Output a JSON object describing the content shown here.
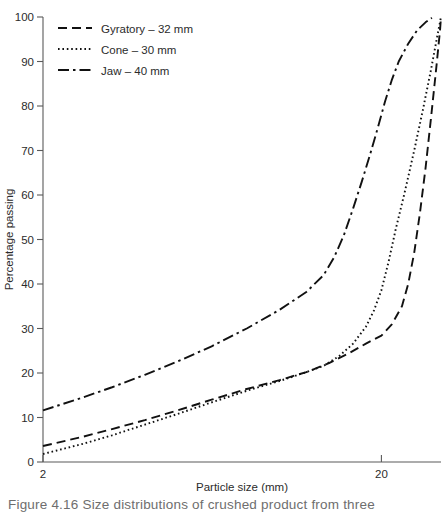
{
  "figure": {
    "caption": "Figure 4.16  Size distributions of crushed product from three"
  },
  "chart_data": {
    "type": "line",
    "title": "",
    "xlabel": "Particle size (mm)",
    "ylabel": "Percentage passing",
    "xscale": "log",
    "xlim": [
      2,
      30
    ],
    "ylim": [
      0,
      100
    ],
    "grid": false,
    "legend_position": "top-left",
    "xticks": [
      {
        "value": 2,
        "label": "2"
      },
      {
        "value": 20,
        "label": "20"
      }
    ],
    "yticks": [
      {
        "value": 0,
        "label": "0"
      },
      {
        "value": 10,
        "label": "10"
      },
      {
        "value": 20,
        "label": "20"
      },
      {
        "value": 30,
        "label": "30"
      },
      {
        "value": 40,
        "label": "40"
      },
      {
        "value": 50,
        "label": "50"
      },
      {
        "value": 60,
        "label": "60"
      },
      {
        "value": 70,
        "label": "70"
      },
      {
        "value": 80,
        "label": "80"
      },
      {
        "value": 90,
        "label": "90"
      },
      {
        "value": 100,
        "label": "100"
      }
    ],
    "series": [
      {
        "name": "Gyratory – 32 mm",
        "legend_label": "Gyratory – 32 mm",
        "style": "dashed",
        "dasharray": "9,5",
        "points": [
          [
            2.0,
            3.6
          ],
          [
            2.6,
            5.6
          ],
          [
            3.2,
            7.4
          ],
          [
            4.0,
            9.4
          ],
          [
            5.0,
            11.6
          ],
          [
            6.3,
            14.0
          ],
          [
            8.0,
            16.4
          ],
          [
            10.0,
            18.4
          ],
          [
            12.0,
            20.2
          ],
          [
            14.0,
            22.2
          ],
          [
            16.0,
            24.4
          ],
          [
            18.0,
            26.6
          ],
          [
            20.0,
            28.4
          ],
          [
            21.5,
            31.0
          ],
          [
            23.0,
            35.0
          ],
          [
            24.0,
            40.0
          ],
          [
            25.0,
            47.0
          ],
          [
            26.0,
            56.0
          ],
          [
            27.0,
            66.0
          ],
          [
            28.0,
            77.0
          ],
          [
            29.0,
            88.0
          ],
          [
            29.8,
            97.0
          ],
          [
            30.0,
            100.0
          ]
        ]
      },
      {
        "name": "Cone – 30 mm",
        "legend_label": "Cone – 30 mm",
        "style": "dotted",
        "dasharray": "1.6,2.8",
        "points": [
          [
            2.0,
            1.8
          ],
          [
            2.6,
            4.0
          ],
          [
            3.2,
            6.0
          ],
          [
            4.0,
            8.4
          ],
          [
            5.0,
            10.8
          ],
          [
            6.3,
            13.4
          ],
          [
            8.0,
            16.0
          ],
          [
            10.0,
            18.2
          ],
          [
            12.0,
            20.2
          ],
          [
            13.5,
            21.6
          ],
          [
            15.0,
            23.8
          ],
          [
            16.5,
            26.6
          ],
          [
            18.0,
            30.4
          ],
          [
            19.0,
            34.0
          ],
          [
            20.0,
            38.6
          ],
          [
            21.0,
            45.0
          ],
          [
            22.0,
            52.0
          ],
          [
            23.5,
            61.0
          ],
          [
            25.0,
            70.0
          ],
          [
            26.5,
            79.0
          ],
          [
            28.0,
            88.0
          ],
          [
            29.3,
            96.0
          ],
          [
            30.0,
            100.0
          ]
        ]
      },
      {
        "name": "Jaw – 40 mm",
        "legend_label": "Jaw – 40 mm",
        "style": "dash-dot",
        "dasharray": "11,4,2.5,4",
        "points": [
          [
            2.0,
            11.6
          ],
          [
            2.6,
            14.4
          ],
          [
            3.2,
            16.8
          ],
          [
            4.0,
            19.6
          ],
          [
            5.0,
            22.6
          ],
          [
            6.3,
            26.0
          ],
          [
            8.0,
            30.0
          ],
          [
            10.0,
            34.2
          ],
          [
            12.0,
            38.2
          ],
          [
            13.5,
            42.0
          ],
          [
            14.5,
            46.0
          ],
          [
            15.5,
            51.0
          ],
          [
            16.5,
            57.0
          ],
          [
            17.5,
            63.0
          ],
          [
            18.5,
            69.0
          ],
          [
            19.5,
            75.0
          ],
          [
            20.5,
            81.0
          ],
          [
            21.5,
            86.0
          ],
          [
            22.5,
            90.0
          ],
          [
            24.0,
            94.0
          ],
          [
            25.5,
            97.0
          ],
          [
            27.0,
            98.8
          ],
          [
            28.2,
            99.8
          ]
        ]
      }
    ]
  }
}
